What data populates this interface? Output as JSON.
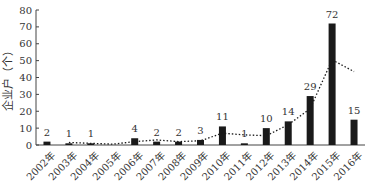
{
  "chart_data": {
    "type": "bar",
    "title": "",
    "xlabel": "",
    "ylabel": "企业户（个）",
    "ylim": [
      0,
      80
    ],
    "yticks": [
      0,
      10,
      20,
      30,
      40,
      50,
      60,
      70,
      80
    ],
    "categories": [
      "2002年",
      "2003年",
      "2004年",
      "2005年",
      "2006年",
      "2007年",
      "2008年",
      "2009年",
      "2010年",
      "2011年",
      "2012年",
      "2013年",
      "2014年",
      "2015年",
      "2016年"
    ],
    "series": [
      {
        "name": "企业户",
        "type": "bar",
        "values": [
          2,
          1,
          1,
          0,
          4,
          2,
          2,
          3,
          11,
          1,
          10,
          14,
          29,
          72,
          15
        ],
        "color": "#1a1a1a"
      },
      {
        "name": "2期移动平均",
        "type": "line",
        "style": "dotted",
        "values": [
          null,
          1.5,
          1,
          0.5,
          2,
          3,
          2,
          2.5,
          7,
          6,
          5.5,
          12,
          21.5,
          50.5,
          43.5
        ],
        "color": "#1a1a1a"
      }
    ],
    "data_labels": [
      "2",
      "1",
      "1",
      "",
      "4",
      "2",
      "2",
      "3",
      "11",
      "1",
      "10",
      "14",
      "29",
      "72",
      "15"
    ],
    "grid": false,
    "legend": "none"
  }
}
